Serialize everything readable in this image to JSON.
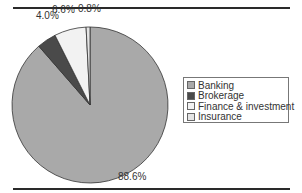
{
  "chart_data": {
    "type": "pie",
    "title": "",
    "categories": [
      "Banking",
      "Brokerage",
      "Finance & investment",
      "Insurance"
    ],
    "values": [
      88.6,
      4.0,
      6.6,
      0.8
    ],
    "value_labels": [
      "88.6%",
      "4.0%",
      "6.6%",
      "0.8%"
    ],
    "colors": [
      "#a9a9a9",
      "#4a4a4a",
      "#f2f2f2",
      "#e4e4e4"
    ],
    "legend_position": "right",
    "start_angle": "12 o'clock, clockwise for Banking"
  },
  "labels": {
    "banking": "88.6%",
    "brokerage": "4.0%",
    "finance": "6.6%",
    "insurance": "0.8%"
  },
  "legend": {
    "items": [
      {
        "label": "Banking",
        "color": "#a9a9a9"
      },
      {
        "label": "Brokerage",
        "color": "#4a4a4a"
      },
      {
        "label": "Finance & investment",
        "color": "#f2f2f2"
      },
      {
        "label": "Insurance",
        "color": "#e4e4e4"
      }
    ]
  }
}
